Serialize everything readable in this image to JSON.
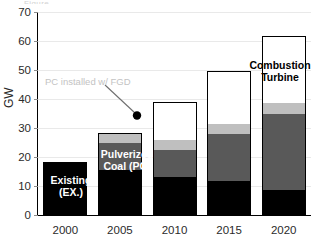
{
  "top_crop_artifact": "Figure",
  "axis": {
    "y_title": "GW",
    "y_ticks": [
      "0",
      "10",
      "20",
      "30",
      "40",
      "50",
      "60",
      "70"
    ],
    "x_ticks": [
      "2000",
      "2005",
      "2010",
      "2015",
      "2020"
    ]
  },
  "annotations": {
    "existing": "Existing\n(EX.)",
    "pulverized_coal": "Pulverized\nCoal (PC)",
    "combustion_turbine": "Combustion\nTurbine",
    "fgd_callout": "PC installed w/ FGD"
  },
  "colors": {
    "existing": "#000000",
    "pulverized_coal": "#595959",
    "fgd": "#bfbfbf",
    "combustion_turbine": "#ffffff",
    "grid": "#e9e9e9",
    "axis": "#000000",
    "callout_text": "#c3c3c3"
  },
  "chart_data": {
    "type": "bar",
    "title": "",
    "xlabel": "",
    "ylabel": "GW",
    "ylim": [
      0,
      70
    ],
    "ytick_step": 10,
    "grid": true,
    "legend": "in-plot labels",
    "stacked": true,
    "categories": [
      "2000",
      "2005",
      "2010",
      "2015",
      "2020"
    ],
    "series": [
      {
        "name": "Existing (EX.)",
        "values": [
          18.3,
          15.5,
          13.0,
          11.9,
          8.7
        ]
      },
      {
        "name": "Pulverized Coal (PC)",
        "values": [
          0,
          9.2,
          9.3,
          16.0,
          26.1
        ]
      },
      {
        "name": "PC installed w/ FGD",
        "values": [
          0,
          3.6,
          3.6,
          3.5,
          3.8
        ]
      },
      {
        "name": "Combustion Turbine",
        "values": [
          0,
          0,
          13.2,
          18.4,
          23.1
        ]
      }
    ],
    "totals": [
      18.3,
      28.3,
      25.9,
      31.4,
      38.6
    ],
    "stack_totals": [
      18.3,
      28.3,
      39.1,
      49.8,
      61.7
    ]
  }
}
